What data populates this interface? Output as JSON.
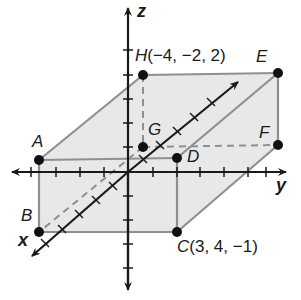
{
  "diagram": {
    "type": "3d-coordinate-rectangular-prism",
    "axes": {
      "x": "x",
      "y": "y",
      "z": "z"
    },
    "vertices": {
      "A": {
        "label": "A"
      },
      "B": {
        "label": "B"
      },
      "C": {
        "label": "C",
        "coords": "(3, 4, −1)"
      },
      "D": {
        "label": "D"
      },
      "E": {
        "label": "E"
      },
      "F": {
        "label": "F"
      },
      "G": {
        "label": "G"
      },
      "H": {
        "label": "H",
        "coords": "(−4, −2, 2)"
      }
    },
    "colors": {
      "face_fill": "#e6e6e6",
      "edge": "#8c8c8c",
      "axis": "#1a1a1a",
      "point": "#111111"
    }
  }
}
